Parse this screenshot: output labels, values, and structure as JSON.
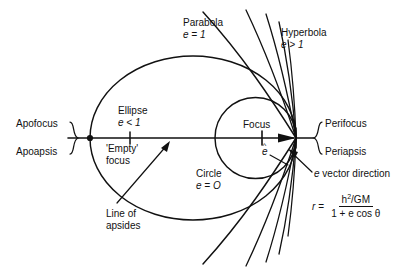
{
  "figure": {
    "background_color": "#ffffff",
    "stroke_color": "#111111"
  },
  "labels": {
    "parabola": {
      "name": "Parabola",
      "eccentricity": "e = 1"
    },
    "hyperbola": {
      "name": "Hyperbola",
      "eccentricity": "e > 1"
    },
    "ellipse": {
      "name": "Ellipse",
      "eccentricity": "e < 1"
    },
    "circle": {
      "name": "Circle",
      "eccentricity": "e = O"
    },
    "empty_focus": {
      "line1": "'Empty'",
      "line2": "focus"
    },
    "focus": "Focus",
    "apofocus": "Apofocus",
    "apoapsis": "Apoapsis",
    "perifocus": "Perifocus",
    "periapsis": "Periapsis",
    "e_vector_direction": "e vector direction",
    "line_of_apsides": {
      "line1": "Line of",
      "line2": "apsides"
    },
    "e_hat": "e"
  },
  "formula": {
    "lhs": "r",
    "equals": "=",
    "numerator_base": "h",
    "numerator_exponent": "2",
    "numerator_rest": "/GM",
    "denominator": "1 + e cos θ"
  },
  "geometry": {
    "periapsis_point": [
      296,
      138
    ],
    "focus_point": [
      262,
      138
    ],
    "empty_focus_point": [
      130,
      138
    ],
    "apoapsis_point": [
      90,
      138
    ],
    "axis_y": 138,
    "circle_center": [
      255.5,
      138
    ],
    "circle_radius": 40.5,
    "ellipse_center": [
      193,
      138
    ],
    "ellipse_rx": 103,
    "ellipse_ry": 82
  }
}
